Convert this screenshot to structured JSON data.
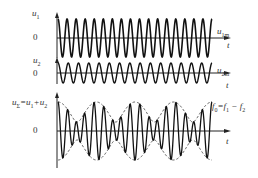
{
  "diagram": {
    "axis_x": 57,
    "axis_end_x": 231,
    "wave_start_x": 58,
    "wave_end_x": 212,
    "panels": [
      {
        "id": "u1",
        "y_label": "u",
        "y_label_sub": "1",
        "zero_label": "0",
        "amp_label": "u",
        "amp_label_sub": "1m",
        "t_label": "t",
        "zero_y": 38,
        "top_y": 12,
        "bottom_y": 58,
        "amplitude": 19,
        "cycles": 17
      },
      {
        "id": "u2",
        "y_label": "u",
        "y_label_sub": "2",
        "zero_label": "0",
        "amp_label": "u",
        "amp_label_sub": "2m",
        "t_label": "t",
        "zero_y": 73,
        "top_y": 57,
        "bottom_y": 84,
        "amplitude": 10,
        "cycles": 15
      },
      {
        "id": "usum",
        "y_label": "u",
        "y_label_sub": "Σ",
        "y_label_eq": "=u",
        "y_label_eq_sub1": "1",
        "y_label_plus": "+u",
        "y_label_eq_sub2": "2",
        "zero_label": "0",
        "beat_label": "f",
        "beat_label_sub": "0",
        "beat_label_rest": "=f",
        "beat_label_sub1": "1",
        "beat_label_minus": " − f",
        "beat_label_sub2": "2",
        "t_label": "t",
        "zero_y": 131,
        "top_y": 92,
        "bottom_y": 168,
        "amp1": 19,
        "amp2": 10,
        "cycles1": 17,
        "cycles2": 13
      }
    ],
    "colors": {
      "wave": "#111111",
      "axis": "#222222",
      "envelope": "#444444",
      "text": "#333333"
    }
  }
}
